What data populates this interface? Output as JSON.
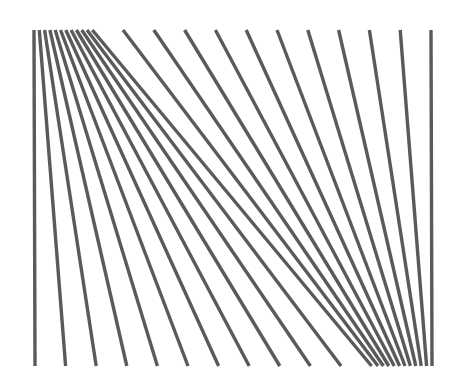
{
  "figure": {
    "stroke_color": "#5a5a5a",
    "stroke_width": 3.4,
    "top_y": 30,
    "bottom_y": 366,
    "top_x": [
      34,
      39.3,
      44.6,
      49.9,
      55.2,
      60.5,
      65.8,
      71.1,
      76.4,
      81.7,
      87,
      92.3,
      123,
      153.8,
      184.6,
      215.4,
      246.2,
      277,
      307.8,
      338.6,
      369.4,
      400.2,
      431
    ],
    "bottom_x": [
      35,
      65.6,
      96.2,
      126.8,
      157.4,
      188,
      218.6,
      249.2,
      279.8,
      310.4,
      341,
      371.6,
      378,
      383.4,
      388.8,
      394.2,
      399.6,
      405,
      410.4,
      415.8,
      421.2,
      426.6,
      432
    ]
  }
}
